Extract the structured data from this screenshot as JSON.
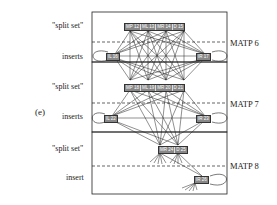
{
  "figure_label": "(e)",
  "panels": [
    {
      "name": "MATP 6",
      "row1_label": "\"split set\"",
      "row2_label": "inserts",
      "split_set": [
        "MP 12",
        "ML 13",
        "MR 14",
        "D 15"
      ],
      "inserts": [
        "IL 16",
        "IR 17"
      ]
    },
    {
      "name": "MATP 7",
      "row1_label": "\"split set\"",
      "row2_label": "inserts",
      "split_set": [
        "MP 18",
        "ML 19",
        "MR 20",
        "D 21"
      ],
      "inserts": [
        "IL 22",
        "IR 23"
      ]
    },
    {
      "name": "MATP 8",
      "row1_label": "\"split set\"",
      "row2_label": "insert",
      "split_set": [
        "MR 24",
        "D 25"
      ],
      "inserts": [
        "IR 26"
      ]
    }
  ]
}
